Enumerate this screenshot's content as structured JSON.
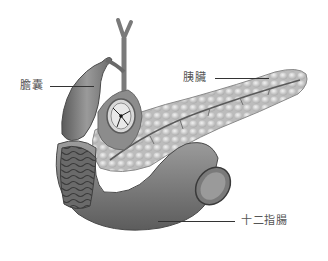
{
  "diagram": {
    "type": "anatomical-illustration",
    "labels": [
      {
        "id": "gallbladder",
        "text": "膽囊"
      },
      {
        "id": "pancreas",
        "text": "胰臟"
      },
      {
        "id": "duodenum",
        "text": "十二指腸"
      }
    ]
  },
  "colors": {
    "background": "#ffffff",
    "organ_dark": "#6e6e6e",
    "organ_mid": "#a8a8a8",
    "organ_light": "#e2e2e2",
    "label_text": "#555555",
    "leader_line": "#333333"
  }
}
